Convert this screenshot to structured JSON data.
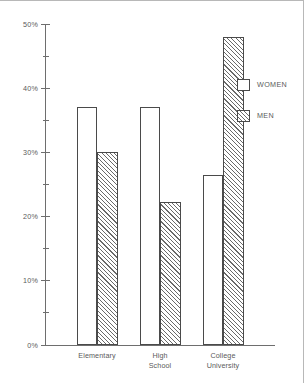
{
  "chart_data": {
    "type": "bar",
    "title": "",
    "xlabel": "",
    "ylabel": "",
    "ylim": [
      0,
      50
    ],
    "y_unit": "%",
    "grid": false,
    "legend_position": "right",
    "categories": [
      "Elementary",
      "High School",
      "College University"
    ],
    "category_lines": [
      [
        "Elementary"
      ],
      [
        "High",
        "School"
      ],
      [
        "College",
        "University"
      ]
    ],
    "y_ticks_major": [
      "0%",
      "10%",
      "20%",
      "30%",
      "40%",
      "50%"
    ],
    "y_ticks_major_values": [
      0,
      10,
      20,
      30,
      40,
      50
    ],
    "y_ticks_minor_values": [
      5,
      15,
      25,
      35,
      45
    ],
    "series": [
      {
        "name": "WOMEN",
        "pattern": "dotted",
        "values": [
          37,
          37,
          26.5
        ]
      },
      {
        "name": "MEN",
        "pattern": "diagonal-hatch",
        "values": [
          30,
          22.2,
          48
        ]
      }
    ]
  },
  "legend": {
    "items": [
      {
        "label": "WOMEN",
        "pattern": "dotted"
      },
      {
        "label": "MEN",
        "pattern": "diagonal-hatch"
      }
    ]
  },
  "colors": {
    "axis": "#6e6e6e",
    "bar_outline": "#4a4a4a",
    "text": "#5a5a5a",
    "frame": "#b8b8b8",
    "background": "#ffffff"
  }
}
